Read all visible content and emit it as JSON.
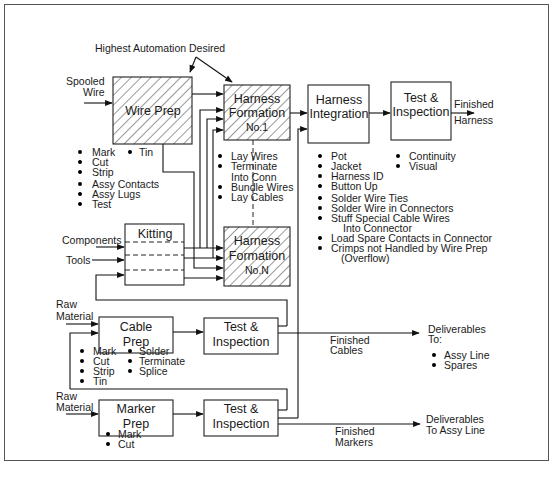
{
  "annotation": {
    "highest_automation": "Highest Automation Desired"
  },
  "inputs": {
    "spooled_wire": [
      "Spooled",
      "Wire"
    ],
    "components": "Components",
    "tools": "Tools",
    "raw_material_cable": [
      "Raw",
      "Material"
    ],
    "raw_material_marker": [
      "Raw",
      "Material"
    ]
  },
  "nodes": {
    "wire_prep": {
      "label": "Wire Prep",
      "hatched": true,
      "tasks": [
        "Mark",
        "Cut",
        "Strip",
        "Assy Contacts",
        "Assy Lugs",
        "Test"
      ],
      "tasks_right": [
        "Tin"
      ]
    },
    "harness_formation_1": {
      "label": [
        "Harness",
        "Formation",
        "No.1"
      ],
      "hatched": true,
      "tasks": [
        "Lay Wires",
        "Terminate",
        "Into Conn",
        "Bundle Wires",
        "Lay Cables"
      ]
    },
    "harness_formation_n": {
      "label": [
        "Harness",
        "Formation",
        "No.N"
      ],
      "hatched": true
    },
    "kitting": {
      "label": "Kitting"
    },
    "harness_integration": {
      "label": [
        "Harness",
        "Integration"
      ],
      "tasks": [
        "Pot",
        "Jacket",
        "Harness ID",
        "Button Up",
        "Solder Wire Ties",
        "Solder Wire in Connectors",
        "Stuff Special Cable Wires",
        "Into Connector",
        "Load Spare Contacts in Connector",
        "Crimps not Handled by Wire Prep",
        "(Overflow)"
      ]
    },
    "test_inspection_harness": {
      "label": [
        "Test &",
        "Inspection"
      ],
      "tasks": [
        "Continuity",
        "Visual"
      ]
    },
    "cable_prep": {
      "label": [
        "Cable",
        "Prep"
      ],
      "tasks_left": [
        "Mark",
        "Cut",
        "Strip",
        "Tin"
      ],
      "tasks_right": [
        "Solder",
        "Terminate",
        "Splice"
      ]
    },
    "test_inspection_cable": {
      "label": [
        "Test &",
        "Inspection"
      ]
    },
    "marker_prep": {
      "label": [
        "Marker",
        "Prep"
      ],
      "tasks": [
        "Mark",
        "Cut"
      ]
    },
    "test_inspection_marker": {
      "label": [
        "Test &",
        "Inspection"
      ]
    }
  },
  "outputs": {
    "finished_harness": [
      "Finished",
      "Harness"
    ],
    "finished_cables": [
      "Finished",
      "Cables"
    ],
    "finished_markers": [
      "Finished",
      "Markers"
    ],
    "deliverables_cables": {
      "title": [
        "Deliverables",
        "To:"
      ],
      "items": [
        "Assy Line",
        "Spares"
      ]
    },
    "deliverables_markers": [
      "Deliverables",
      "To Assy Line"
    ]
  }
}
